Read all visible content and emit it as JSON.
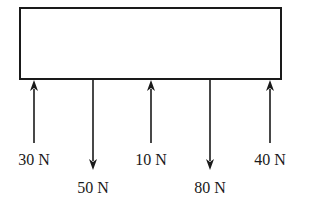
{
  "diagram": {
    "type": "free-body-diagram",
    "body": {
      "shape": "rectangle",
      "x": 20,
      "y": 8,
      "width": 261,
      "height": 71
    },
    "colors": {
      "stroke": "#1a1a1a",
      "background": "#ffffff"
    },
    "forces": [
      {
        "label": "30 N",
        "magnitude": 30,
        "unit": "N",
        "direction": "up",
        "x": 34,
        "tail_y": 143,
        "label_y": 165
      },
      {
        "label": "50 N",
        "magnitude": 50,
        "unit": "N",
        "direction": "down",
        "x": 93,
        "tip_y": 170,
        "label_y": 193
      },
      {
        "label": "10 N",
        "magnitude": 10,
        "unit": "N",
        "direction": "up",
        "x": 151,
        "tail_y": 143,
        "label_y": 165
      },
      {
        "label": "80 N",
        "magnitude": 80,
        "unit": "N",
        "direction": "down",
        "x": 210,
        "tip_y": 170,
        "label_y": 193
      },
      {
        "label": "40 N",
        "magnitude": 40,
        "unit": "N",
        "direction": "up",
        "x": 270,
        "tail_y": 143,
        "label_y": 165
      }
    ]
  }
}
